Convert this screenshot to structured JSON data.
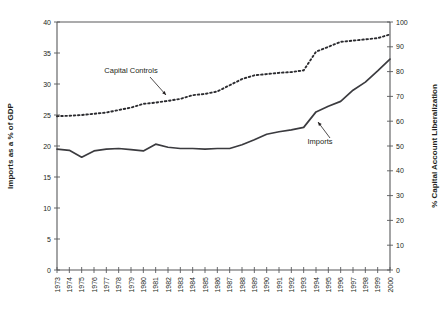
{
  "chart_data": {
    "type": "line",
    "title": "",
    "xlabel": "",
    "ylabel": "Imports as a % of GDP",
    "y2label": "% Capital Account Liberalization",
    "grid": false,
    "legend_position": "inline-annotations",
    "xlim": [
      1973,
      2000
    ],
    "ylim": [
      0,
      40
    ],
    "y2lim": [
      0,
      100
    ],
    "yticks": [
      0,
      5,
      10,
      15,
      20,
      25,
      30,
      35,
      40
    ],
    "y2ticks": [
      0,
      10,
      20,
      30,
      40,
      50,
      60,
      70,
      80,
      90,
      100
    ],
    "x": [
      1973,
      1974,
      1975,
      1976,
      1977,
      1978,
      1979,
      1980,
      1981,
      1982,
      1983,
      1984,
      1985,
      1986,
      1987,
      1988,
      1989,
      1990,
      1991,
      1992,
      1993,
      1994,
      1995,
      1996,
      1997,
      1998,
      1999,
      2000
    ],
    "categories": [
      "1973",
      "1974",
      "1975",
      "1976",
      "1977",
      "1978",
      "1979",
      "1980",
      "1981",
      "1982",
      "1983",
      "1984",
      "1985",
      "1986",
      "1987",
      "1988",
      "1989",
      "1990",
      "1991",
      "1992",
      "1993",
      "1994",
      "1995",
      "1996",
      "1997",
      "1998",
      "1999",
      "2000"
    ],
    "series": [
      {
        "name": "Imports",
        "axis": "left",
        "style": "solid",
        "units": "% of GDP",
        "values": [
          19.5,
          19.3,
          18.2,
          19.2,
          19.5,
          19.6,
          19.4,
          19.2,
          20.3,
          19.8,
          19.6,
          19.6,
          19.5,
          19.6,
          19.6,
          20.2,
          21.0,
          21.9,
          22.3,
          22.6,
          23.0,
          25.5,
          26.4,
          27.2,
          29.0,
          30.3,
          32.1,
          34.0
        ]
      },
      {
        "name": "Capital Controls",
        "axis": "right",
        "style": "dotted",
        "units": "% Capital Account Liberalization",
        "values": [
          62.0,
          62.2,
          62.5,
          63.0,
          63.5,
          64.5,
          65.5,
          67.0,
          67.5,
          68.2,
          69.0,
          70.5,
          71.0,
          72.0,
          74.5,
          77.0,
          78.5,
          79.0,
          79.5,
          79.8,
          80.5,
          88.0,
          90.0,
          92.0,
          92.5,
          93.0,
          93.5,
          95.0
        ]
      }
    ],
    "annotations": [
      {
        "label": "Capital Controls",
        "target_x": 1986,
        "target_series": "Capital Controls"
      },
      {
        "label": "Imports",
        "target_x": 1994,
        "target_series": "Imports"
      }
    ]
  }
}
